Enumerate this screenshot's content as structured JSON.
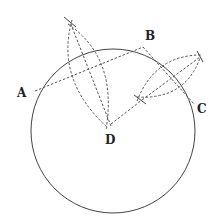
{
  "figure": {
    "title": "",
    "labels": {
      "A": "A",
      "B": "B",
      "C": "C",
      "D": "D"
    },
    "points": {
      "A": [
        35,
        91
      ],
      "B": [
        143,
        47
      ],
      "C": [
        194,
        104
      ],
      "D": [
        110,
        126
      ]
    },
    "circle": {
      "cx": 113,
      "cy": 130,
      "r": 82
    },
    "colors": {
      "stroke": "#444444",
      "background": "#ffffff"
    }
  }
}
